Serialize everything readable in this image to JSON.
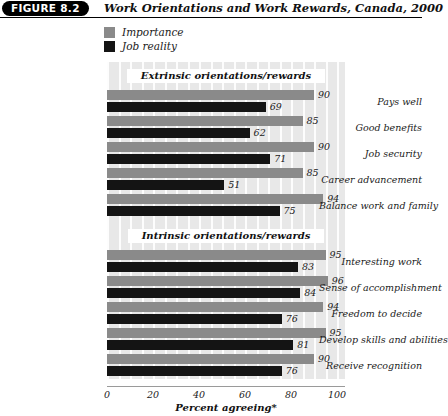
{
  "figure": {
    "badge": "FIGURE 8.2",
    "title": "Work Orientations and Work Rewards, Canada, 2000"
  },
  "legend": {
    "position": "top-left",
    "items": [
      {
        "label": "Importance",
        "color": "#8a8a8a"
      },
      {
        "label": "Job reality",
        "color": "#141414"
      }
    ]
  },
  "chart_data": {
    "type": "bar",
    "orientation": "horizontal",
    "title": "Work Orientations and Work Rewards, Canada, 2000",
    "xlabel": "Percent agreeing*",
    "ylabel": "",
    "xlim": [
      0,
      100
    ],
    "xticks": [
      0,
      20,
      40,
      60,
      80,
      100
    ],
    "xtick_labels": [
      "0",
      "20",
      "40",
      "60",
      "80",
      "100"
    ],
    "grid": true,
    "legend_position": "above-plot-left",
    "series": [
      {
        "name": "Importance",
        "color": "#8a8a8a",
        "values": [
          90,
          85,
          90,
          85,
          94,
          95,
          96,
          94,
          95,
          90
        ]
      },
      {
        "name": "Job reality",
        "color": "#141414",
        "values": [
          69,
          62,
          71,
          51,
          75,
          83,
          84,
          76,
          81,
          76
        ]
      }
    ],
    "categories": [
      "Pays well",
      "Good benefits",
      "Job security",
      "Career advancement",
      "Balance work and family",
      "Interesting work",
      "Sense of accomplishment",
      "Freedom to decide",
      "Develop skills and abilities",
      "Receive recognition"
    ],
    "groups": [
      {
        "header": "Extrinsic orientations/rewards",
        "categories": [
          {
            "label": "Pays well",
            "importance": 90,
            "job_reality": 69
          },
          {
            "label": "Good benefits",
            "importance": 85,
            "job_reality": 62
          },
          {
            "label": "Job security",
            "importance": 90,
            "job_reality": 71
          },
          {
            "label": "Career advancement",
            "importance": 85,
            "job_reality": 51
          },
          {
            "label": "Balance work and family",
            "importance": 94,
            "job_reality": 75
          }
        ]
      },
      {
        "header": "Intrinsic orientations/rewards",
        "categories": [
          {
            "label": "Interesting work",
            "importance": 95,
            "job_reality": 83
          },
          {
            "label": "Sense of accomplishment",
            "importance": 96,
            "job_reality": 84
          },
          {
            "label": "Freedom to decide",
            "importance": 94,
            "job_reality": 76
          },
          {
            "label": "Develop skills and abilities",
            "importance": 95,
            "job_reality": 81
          },
          {
            "label": "Receive recognition",
            "importance": 90,
            "job_reality": 76
          }
        ]
      }
    ]
  }
}
